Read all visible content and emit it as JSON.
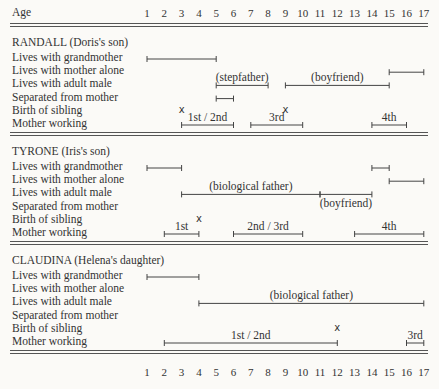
{
  "axis": {
    "label": "Age",
    "ticks": [
      "1",
      "2",
      "3",
      "4",
      "5",
      "6",
      "7",
      "8",
      "9",
      "10",
      "11",
      "12",
      "13",
      "14",
      "15",
      "16",
      "17"
    ]
  },
  "row_labels": [
    "Lives with grandmother",
    "Lives with mother alone",
    "Lives with adult male",
    "Separated from mother",
    "Birth of sibling",
    "Mother working"
  ],
  "sections": [
    {
      "title": "RANDALL (Doris's son)"
    },
    {
      "title": "TYRONE (Iris's son)"
    },
    {
      "title": "CLAUDINA (Helena's daughter)"
    }
  ],
  "chart_data": {
    "type": "timeline",
    "title": "",
    "xlabel": "Age",
    "xlim": [
      1,
      17
    ],
    "categories": [
      "Lives with grandmother",
      "Lives with mother alone",
      "Lives with adult male",
      "Separated from mother",
      "Birth of sibling",
      "Mother working"
    ],
    "children": [
      {
        "name": "RANDALL (Doris's son)",
        "intervals": [
          {
            "row": "Lives with grandmother",
            "start": 1,
            "end": 5
          },
          {
            "row": "Lives with mother alone",
            "start": 15,
            "end": 17
          },
          {
            "row": "Lives with adult male",
            "start": 5,
            "end": 8,
            "label": "(stepfather)"
          },
          {
            "row": "Lives with adult male",
            "start": 9,
            "end": 15,
            "label": "(boyfriend)"
          },
          {
            "row": "Separated from mother",
            "start": 5,
            "end": 6
          },
          {
            "row": "Mother working",
            "start": 3,
            "end": 6,
            "label": "1st / 2nd"
          },
          {
            "row": "Mother working",
            "start": 7,
            "end": 10,
            "label": "3rd"
          },
          {
            "row": "Mother working",
            "start": 14,
            "end": 16,
            "label": "4th"
          }
        ],
        "events": [
          {
            "row": "Birth of sibling",
            "age": 3,
            "marker": "x"
          },
          {
            "row": "Birth of sibling",
            "age": 9,
            "marker": "x"
          }
        ]
      },
      {
        "name": "TYRONE (Iris's son)",
        "intervals": [
          {
            "row": "Lives with grandmother",
            "start": 1,
            "end": 3
          },
          {
            "row": "Lives with grandmother",
            "start": 14,
            "end": 15
          },
          {
            "row": "Lives with mother alone",
            "start": 15,
            "end": 17
          },
          {
            "row": "Lives with adult male",
            "start": 3,
            "end": 11,
            "label": "(biological father)"
          },
          {
            "row": "Lives with adult male",
            "start": 11,
            "end": 14,
            "label": "(boyfriend)"
          },
          {
            "row": "Mother working",
            "start": 2,
            "end": 4,
            "label": "1st"
          },
          {
            "row": "Mother working",
            "start": 6,
            "end": 10,
            "label": "2nd / 3rd"
          },
          {
            "row": "Mother working",
            "start": 13,
            "end": 17,
            "label": "4th"
          }
        ],
        "events": [
          {
            "row": "Birth of sibling",
            "age": 4,
            "marker": "x"
          }
        ]
      },
      {
        "name": "CLAUDINA (Helena's daughter)",
        "intervals": [
          {
            "row": "Lives with grandmother",
            "start": 1,
            "end": 4
          },
          {
            "row": "Lives with adult male",
            "start": 4,
            "end": 17,
            "label": "(biological father)"
          },
          {
            "row": "Mother working",
            "start": 2,
            "end": 12,
            "label": "1st / 2nd"
          },
          {
            "row": "Mother working",
            "start": 16,
            "end": 17,
            "label": "3rd"
          }
        ],
        "events": [
          {
            "row": "Birth of sibling",
            "age": 12,
            "marker": "x"
          }
        ]
      }
    ]
  }
}
